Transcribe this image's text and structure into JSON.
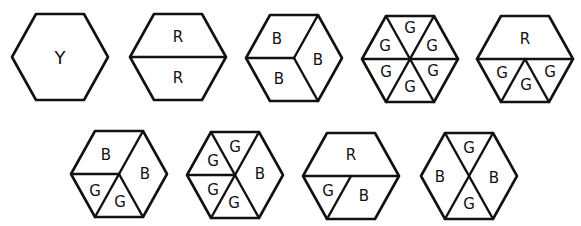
{
  "figure": {
    "stroke_color": "#111111",
    "background": "#ffffff",
    "legend_letters": {
      "Y": "yellow",
      "R": "red",
      "B": "blue",
      "G": "green"
    },
    "rows": [
      {
        "hexagons": [
          {
            "id": 1,
            "center": [
              60,
              57
            ],
            "dividers": [],
            "regions": [
              {
                "label": "Y",
                "pos": [
                  60,
                  57
                ],
                "big": true
              }
            ]
          },
          {
            "id": 2,
            "center": [
              178,
              57
            ],
            "dividers": [
              [
                "L",
                "R"
              ]
            ],
            "regions": [
              {
                "label": "R",
                "pos": [
                  178,
                  37
                ]
              },
              {
                "label": "R",
                "pos": [
                  178,
                  78
                ]
              }
            ]
          },
          {
            "id": 3,
            "center": [
              294,
              58
            ],
            "dividers": [
              [
                "L",
                "C"
              ],
              [
                "C",
                "TR"
              ],
              [
                "C",
                "BR"
              ]
            ],
            "regions": [
              {
                "label": "B",
                "pos": [
                  277,
                  39
                ]
              },
              {
                "label": "B",
                "pos": [
                  279,
                  79
                ]
              },
              {
                "label": "B",
                "pos": [
                  318,
                  60
                ]
              }
            ]
          },
          {
            "id": 4,
            "center": [
              410,
              59
            ],
            "dividers": [
              [
                "L",
                "R"
              ],
              [
                "TL",
                "BR"
              ],
              [
                "TR",
                "BL"
              ]
            ],
            "regions": [
              {
                "label": "G",
                "pos": [
                  410,
                  28
                ]
              },
              {
                "label": "G",
                "pos": [
                  385,
                  46
                ]
              },
              {
                "label": "G",
                "pos": [
                  432,
                  46
                ]
              },
              {
                "label": "G",
                "pos": [
                  386,
                  72
                ]
              },
              {
                "label": "G",
                "pos": [
                  433,
                  71
                ]
              },
              {
                "label": "G",
                "pos": [
                  410,
                  87
                ]
              }
            ]
          },
          {
            "id": 5,
            "center": [
              525,
              59
            ],
            "dividers": [
              [
                "L",
                "R"
              ],
              [
                "C",
                "BL"
              ],
              [
                "C",
                "BR"
              ]
            ],
            "regions": [
              {
                "label": "R",
                "pos": [
                  525,
                  39
                ]
              },
              {
                "label": "G",
                "pos": [
                  502,
                  73
                ]
              },
              {
                "label": "G",
                "pos": [
                  526,
                  85
                ]
              },
              {
                "label": "G",
                "pos": [
                  550,
                  72
                ]
              }
            ]
          }
        ]
      },
      {
        "hexagons": [
          {
            "id": 6,
            "center": [
              119,
              174
            ],
            "dividers": [
              [
                "L",
                "C"
              ],
              [
                "C",
                "TR"
              ],
              [
                "C",
                "BL"
              ],
              [
                "C",
                "BR"
              ]
            ],
            "regions": [
              {
                "label": "B",
                "pos": [
                  106,
                  155
                ]
              },
              {
                "label": "B",
                "pos": [
                  145,
                  174
                ]
              },
              {
                "label": "G",
                "pos": [
                  95,
                  191
                ]
              },
              {
                "label": "G",
                "pos": [
                  120,
                  202
                ]
              }
            ]
          },
          {
            "id": 7,
            "center": [
              235,
              175
            ],
            "dividers": [
              [
                "L",
                "C"
              ],
              [
                "TL",
                "C"
              ],
              [
                "C",
                "TR"
              ],
              [
                "C",
                "BL"
              ],
              [
                "C",
                "BR"
              ]
            ],
            "regions": [
              {
                "label": "G",
                "pos": [
                  213,
                  161
                ]
              },
              {
                "label": "G",
                "pos": [
                  235,
                  147
                ]
              },
              {
                "label": "B",
                "pos": [
                  260,
                  174
                ]
              },
              {
                "label": "G",
                "pos": [
                  213,
                  190
                ]
              },
              {
                "label": "G",
                "pos": [
                  234,
                  203
                ]
              }
            ]
          },
          {
            "id": 8,
            "center": [
              351,
              176
            ],
            "dividers": [
              [
                "L",
                "R"
              ],
              [
                "C",
                "BL"
              ]
            ],
            "regions": [
              {
                "label": "R",
                "pos": [
                  351,
                  155
                ]
              },
              {
                "label": "G",
                "pos": [
                  328,
                  191
                ]
              },
              {
                "label": "B",
                "pos": [
                  364,
                  196
                ]
              }
            ]
          },
          {
            "id": 9,
            "center": [
              469,
              176
            ],
            "dividers": [
              [
                "TL",
                "BR"
              ],
              [
                "TR",
                "BL"
              ]
            ],
            "regions": [
              {
                "label": "G",
                "pos": [
                  469,
                  148
                ]
              },
              {
                "label": "B",
                "pos": [
                  440,
                  177
                ]
              },
              {
                "label": "B",
                "pos": [
                  494,
                  178
                ]
              },
              {
                "label": "G",
                "pos": [
                  469,
                  204
                ]
              }
            ]
          }
        ]
      }
    ]
  }
}
